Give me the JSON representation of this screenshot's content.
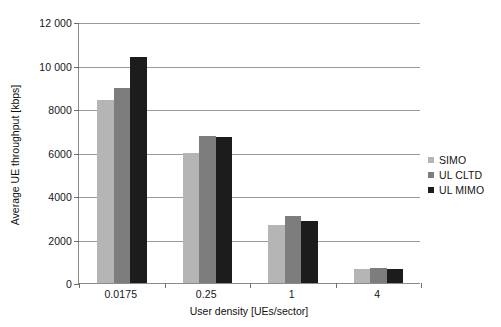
{
  "chart_data": {
    "type": "bar",
    "title": "",
    "categories": [
      "0.0175",
      "0.25",
      "1",
      "4"
    ],
    "series": [
      {
        "name": "SIMO",
        "color": "#b5b5b5",
        "values": [
          8400,
          6000,
          2650,
          650
        ]
      },
      {
        "name": "UL CLTD",
        "color": "#7d7d7d",
        "values": [
          8950,
          6750,
          3100,
          680
        ]
      },
      {
        "name": "UL MIMO",
        "color": "#1c1c1c",
        "values": [
          10400,
          6700,
          2850,
          630
        ]
      }
    ],
    "xlabel": "User density [UEs/sector]",
    "ylabel": "Average UE throughput [kbps]",
    "ylim": [
      0,
      12000
    ],
    "ytick_values": [
      0,
      2000,
      4000,
      6000,
      8000,
      10000,
      12000
    ],
    "ytick_labels": [
      "0",
      "2000",
      "4000",
      "6000",
      "8000",
      "10 000",
      "12 000"
    ],
    "grid": true,
    "legend_position": "right"
  },
  "legend": {
    "items": [
      {
        "label": "SIMO"
      },
      {
        "label": "UL CLTD"
      },
      {
        "label": "UL MIMO"
      }
    ]
  },
  "axes": {
    "y_title": "Average UE throughput [kbps]",
    "x_title": "User density [UEs/sector]"
  }
}
